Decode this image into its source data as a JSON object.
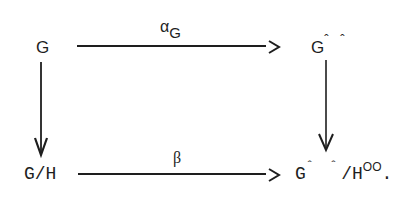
{
  "diagram": {
    "type": "commutative-square",
    "nodes": {
      "top_left": {
        "text": "G"
      },
      "top_right": {
        "base": "G",
        "superscript": "ˆ ˆ"
      },
      "bottom_left": {
        "text": "G/H"
      },
      "bottom_right": {
        "base": "G",
        "superscript": "ˆ ˆ",
        "mid": "/H",
        "superscript2": "OO",
        "trailing": "."
      }
    },
    "arrows": {
      "top": {
        "from": "G",
        "to": "G^^",
        "label_base": "α",
        "label_sub": "G"
      },
      "bottom": {
        "from": "G/H",
        "to": "G^^/H^oo",
        "label": "β"
      },
      "left": {
        "from": "G",
        "to": "G/H",
        "label": ""
      },
      "right": {
        "from": "G^^",
        "to": "G^^/H^oo",
        "label": ""
      }
    },
    "colors": {
      "ink": "#1e1e1e",
      "background": "#ffffff"
    }
  }
}
